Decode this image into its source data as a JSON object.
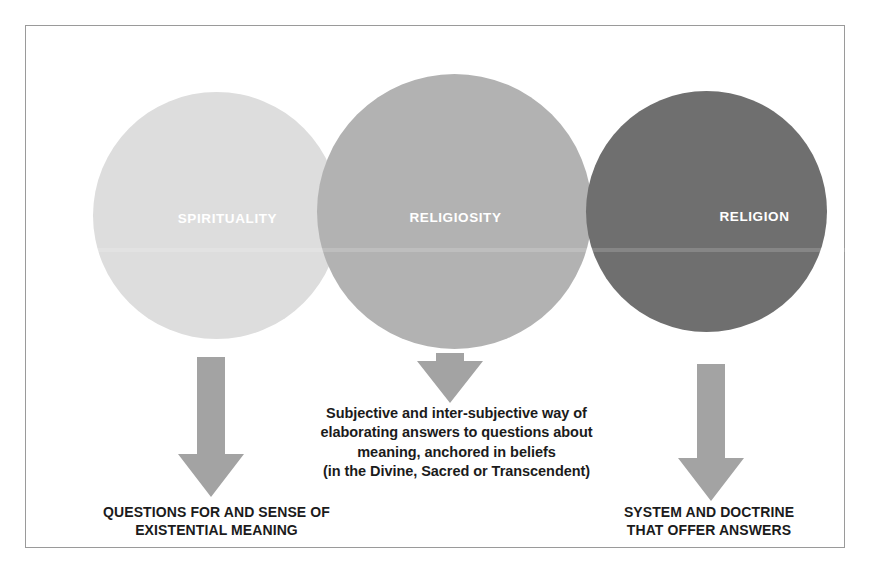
{
  "figure": {
    "frame_border_color": "#9a9a9a",
    "background_color": "#ffffff"
  },
  "circles": [
    {
      "id": "spirituality",
      "label": "SPIRITUALITY",
      "fill": "#dddddd",
      "label_color": "#ffffff"
    },
    {
      "id": "religiosity",
      "label": "RELIGIOSITY",
      "fill": "#b2b2b2",
      "label_color": "#ffffff"
    },
    {
      "id": "religion",
      "label": "RELIGION",
      "fill": "#6f6f6f",
      "label_color": "#ffffff"
    }
  ],
  "arrows": [
    {
      "id": "left",
      "direction": "down",
      "color": "#a3a3a3"
    },
    {
      "id": "middle",
      "direction": "down",
      "color": "#a3a3a3"
    },
    {
      "id": "right",
      "direction": "down",
      "color": "#a3a3a3"
    }
  ],
  "captions": {
    "left": {
      "line1": "QUESTIONS FOR AND SENSE OF",
      "line2": "EXISTENTIAL MEANING"
    },
    "middle": {
      "line1": "Subjective and inter-subjective way of",
      "line2": "elaborating answers to questions about",
      "line3": "meaning, anchored in beliefs",
      "line4": "(in the Divine, Sacred or Transcendent)"
    },
    "right": {
      "line1": "SYSTEM AND DOCTRINE",
      "line2": "THAT OFFER ANSWERS"
    }
  }
}
